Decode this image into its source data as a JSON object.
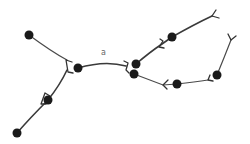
{
  "diagram": {
    "label": "a",
    "colors": {
      "node": "#1a1a1a",
      "edge": "#3a3a3a",
      "label": "#666666",
      "background": "#ffffff"
    },
    "nodes": [
      {
        "id": "n1",
        "x": 29,
        "y": 35
      },
      {
        "id": "n2",
        "x": 78,
        "y": 68
      },
      {
        "id": "n3",
        "x": 136,
        "y": 64
      },
      {
        "id": "n4",
        "x": 134,
        "y": 74
      },
      {
        "id": "n5",
        "x": 172,
        "y": 37
      },
      {
        "id": "n6",
        "x": 177,
        "y": 84
      },
      {
        "id": "n7",
        "x": 217,
        "y": 75
      },
      {
        "id": "n8",
        "x": 48,
        "y": 100
      },
      {
        "id": "n9",
        "x": 17,
        "y": 133
      }
    ]
  }
}
